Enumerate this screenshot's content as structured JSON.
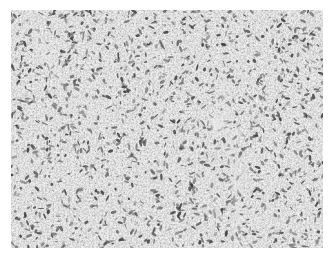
{
  "image": {
    "type": "histology-micrograph",
    "description": "Grayscale photomicrograph of densely cellular tissue with spindle and ovoid nuclei arranged in sheets; faint lighter streaks of stroma/vessels",
    "colors": {
      "background": "#ffffff",
      "tissue_base": "#b9b9b9",
      "nuclei_dark": "#3a3a3a",
      "nuclei_mid": "#6e6e6e",
      "stroma_light": "#e6e6e6"
    },
    "frame": {
      "x": 11,
      "y": 10,
      "width": 312,
      "height": 238
    }
  }
}
